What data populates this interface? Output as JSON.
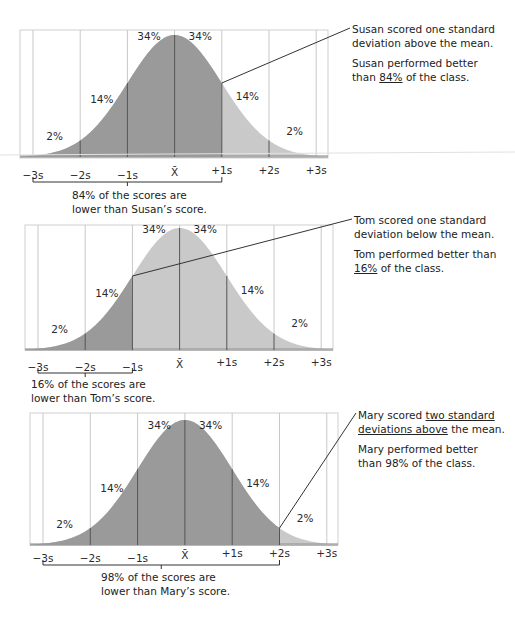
{
  "chart_data": [
    {
      "type": "area",
      "title": "Susan",
      "distribution": "normal",
      "ticks": [
        "−3s",
        "−2s",
        "−1s",
        "X̄",
        "+1s",
        "+2s",
        "+3s"
      ],
      "region_percents": [
        "2%",
        "14%",
        "34%",
        "34%",
        "14%",
        "2%"
      ],
      "shaded_up_to_sd": 1,
      "callout_at_sd": 1,
      "caption": [
        "84% of the scores are",
        "lower than Susan’s score."
      ],
      "bracket_from_sd": -3,
      "bracket_to_sd": 1,
      "note_line1": [
        "Susan scored one standard",
        "deviation above the mean."
      ],
      "note_line2_pre": "Susan performed better",
      "note_line2_mid_pre": "than ",
      "note_line2_u": "84%",
      "note_line2_post": " of the class."
    },
    {
      "type": "area",
      "title": "Tom",
      "distribution": "normal",
      "ticks": [
        "−3s",
        "−2s",
        "−1s",
        "X̄",
        "+1s",
        "+2s",
        "+3s"
      ],
      "region_percents": [
        "2%",
        "14%",
        "34%",
        "34%",
        "14%",
        "2%"
      ],
      "shaded_up_to_sd": -1,
      "callout_at_sd": -1,
      "caption": [
        "16% of the scores are",
        "lower than Tom’s score."
      ],
      "bracket_from_sd": -3,
      "bracket_to_sd": -1,
      "note_line1": [
        "Tom scored one standard",
        "deviation below the mean."
      ],
      "note_line2_pre": "Tom performed better than",
      "note_line2_mid_pre": "",
      "note_line2_u": "16%",
      "note_line2_post": " of the class."
    },
    {
      "type": "area",
      "title": "Mary",
      "distribution": "normal",
      "ticks": [
        "−3s",
        "−2s",
        "−1s",
        "X̄",
        "+1s",
        "+2s",
        "+3s"
      ],
      "region_percents": [
        "2%",
        "14%",
        "34%",
        "34%",
        "14%",
        "2%"
      ],
      "shaded_up_to_sd": 2,
      "callout_at_sd": 2,
      "caption": [
        "98% of the scores are",
        "lower than Mary’s score."
      ],
      "bracket_from_sd": -3,
      "bracket_to_sd": 2,
      "note_line1_pre": "Mary scored ",
      "note_line1_u1": "two standard",
      "note_line1_u2": "deviations above",
      "note_line1_post": " the mean.",
      "note_line2": [
        "Mary performed better",
        "than 98% of the class."
      ]
    }
  ],
  "colors": {
    "dark_fill": "#9a9a9a",
    "light_fill": "#c9c9c9",
    "grid": "#c8c8c8",
    "divider": "#555555",
    "frame": "#cfcfcf"
  }
}
